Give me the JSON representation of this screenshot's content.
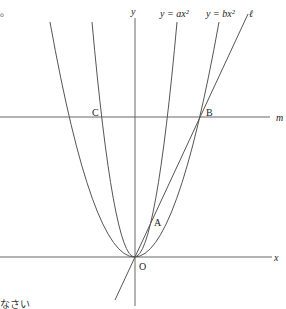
{
  "diagram": {
    "title_fragment_top": "。",
    "text_fragment_bottom": "なさい",
    "axes": {
      "x_label": "x",
      "y_label": "y",
      "origin_label": "O"
    },
    "curves": [
      {
        "name": "parabola-a",
        "label": "y = ax²",
        "equation": "y = ax^2"
      },
      {
        "name": "parabola-b",
        "label": "y = bx²",
        "equation": "y = bx^2"
      }
    ],
    "lines": [
      {
        "name": "line-l",
        "label": "ℓ",
        "description": "line through O and B"
      },
      {
        "name": "line-m",
        "label": "m",
        "description": "horizontal line through C and B"
      }
    ],
    "points": [
      {
        "name": "A",
        "label": "A"
      },
      {
        "name": "B",
        "label": "B"
      },
      {
        "name": "C",
        "label": "C"
      },
      {
        "name": "O",
        "label": "O"
      }
    ],
    "colors": {
      "stroke": "#555555",
      "text": "#222222",
      "background": "#ffffff"
    }
  }
}
